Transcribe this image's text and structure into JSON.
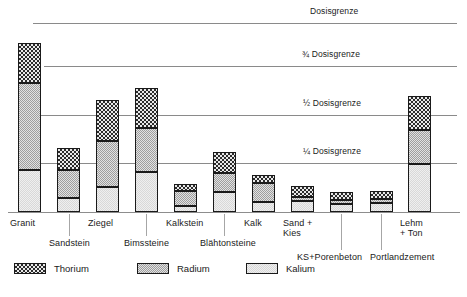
{
  "chart_data": {
    "type": "bar",
    "stacked": true,
    "title": "",
    "xlabel": "",
    "ylabel": "",
    "ylim": [
      0,
      1.15
    ],
    "grid": true,
    "legend_position": "bottom-left",
    "categories": [
      "Granit",
      "Sandstein",
      "Ziegel",
      "Bimssteine",
      "Kalkstein",
      "Blähtonsteine",
      "Kalk",
      "Sand +\nKies",
      "KS+Porenbeton",
      "Portlandzement",
      "Lehm\n+ Ton"
    ],
    "series": [
      {
        "name": "Kalium",
        "values": [
          0.255,
          0.08,
          0.15,
          0.235,
          0.035,
          0.115,
          0.06,
          0.06,
          0.055,
          0.055,
          0.29
        ]
      },
      {
        "name": "Radium",
        "values": [
          0.505,
          0.16,
          0.26,
          0.25,
          0.11,
          0.11,
          0.15,
          0.025,
          0.025,
          0.025,
          0.2
        ]
      },
      {
        "name": "Thorium",
        "values": [
          0.235,
          0.13,
          0.24,
          0.235,
          0.04,
          0.125,
          0.05,
          0.07,
          0.07,
          0.07,
          0.2
        ]
      }
    ],
    "reference_lines": [
      {
        "label": "Dosisgrenze",
        "value": 1.0
      },
      {
        "label": "¾ Dosisgrenze",
        "value": 0.75
      },
      {
        "label": "½ Dosisgrenze",
        "value": 0.5
      },
      {
        "label": "¼ Dosisgrenze",
        "value": 0.25
      }
    ],
    "colors": {
      "thorium": "#2b2b2b",
      "radium": "#9e9e9e",
      "kalium": "#efefef",
      "gridline": "#8a8a8a",
      "baseline": "#8d8d8d",
      "outline": "#1a1a1a"
    }
  },
  "gridlines": [
    {
      "label": "Dosisgrenze",
      "y": 23,
      "x": 33,
      "w": 424,
      "label_x": 310,
      "label_y": 6
    },
    {
      "label": "¾ Dosisgrenze",
      "y": 66,
      "x": 44,
      "w": 413,
      "label_x": 302,
      "label_y": 49
    },
    {
      "label": "½ Dosisgrenze",
      "y": 115,
      "x": 38,
      "w": 419,
      "label_x": 303,
      "label_y": 98
    },
    {
      "label": "¼ Dosisgrenze",
      "y": 163,
      "x": 38,
      "w": 419,
      "label_x": 303,
      "label_y": 146
    }
  ],
  "bars": [
    {
      "name": "granit",
      "label": "Granit",
      "x": 18,
      "w": 23,
      "thorium_top": 43,
      "radium_top": 83,
      "kalium_top": 170,
      "base": 212,
      "label_x": 10,
      "label_y": 218,
      "leader": null
    },
    {
      "name": "sandstein",
      "label": "Sandstein",
      "x": 57,
      "w": 23,
      "thorium_top": 148,
      "radium_top": 170,
      "kalium_top": 198,
      "base": 212,
      "label_x": 49,
      "label_y": 238,
      "leader": {
        "x": 69,
        "top": 214,
        "h": 22
      }
    },
    {
      "name": "ziegel",
      "label": "Ziegel",
      "x": 96,
      "w": 23,
      "thorium_top": 100,
      "radium_top": 141,
      "kalium_top": 187,
      "base": 212,
      "label_x": 88,
      "label_y": 218,
      "leader": null
    },
    {
      "name": "bimssteine",
      "label": "Bimssteine",
      "x": 135,
      "w": 23,
      "thorium_top": 88,
      "radium_top": 128,
      "kalium_top": 172,
      "base": 212,
      "label_x": 124,
      "label_y": 238,
      "leader": {
        "x": 146,
        "top": 214,
        "h": 22
      }
    },
    {
      "name": "kalkstein",
      "label": "Kalkstein",
      "x": 174,
      "w": 23,
      "thorium_top": 184,
      "radium_top": 191,
      "kalium_top": 206,
      "base": 212,
      "label_x": 166,
      "label_y": 218,
      "leader": null
    },
    {
      "name": "blaehtonsteine",
      "label": "Blähtonsteine",
      "x": 213,
      "w": 23,
      "thorium_top": 152,
      "radium_top": 173,
      "kalium_top": 192,
      "base": 212,
      "label_x": 200,
      "label_y": 238,
      "leader": {
        "x": 224,
        "top": 214,
        "h": 22
      }
    },
    {
      "name": "kalk",
      "label": "Kalk",
      "x": 252,
      "w": 23,
      "thorium_top": 175,
      "radium_top": 183,
      "kalium_top": 202,
      "base": 212,
      "label_x": 244,
      "label_y": 218,
      "leader": null
    },
    {
      "name": "sand-kies",
      "label": "Sand +\nKies",
      "x": 291,
      "w": 23,
      "thorium_top": 186,
      "radium_top": 197,
      "kalium_top": 201,
      "base": 212,
      "label_x": 283,
      "label_y": 218,
      "leader": null
    },
    {
      "name": "ks-porenbeton",
      "label": "KS+Porenbeton",
      "x": 330,
      "w": 23,
      "thorium_top": 192,
      "radium_top": 200,
      "kalium_top": 204,
      "base": 212,
      "label_x": 297,
      "label_y": 252,
      "leader": {
        "x": 341,
        "top": 214,
        "h": 36
      }
    },
    {
      "name": "portlandzement",
      "label": "Portlandzement",
      "x": 370,
      "w": 23,
      "thorium_top": 191,
      "radium_top": 199,
      "kalium_top": 203,
      "base": 212,
      "label_x": 370,
      "label_y": 252,
      "leader": {
        "x": 381,
        "top": 214,
        "h": 36
      }
    },
    {
      "name": "lehm-ton",
      "label": "Lehm\n+ Ton",
      "x": 408,
      "w": 23,
      "thorium_top": 96,
      "radium_top": 130,
      "kalium_top": 164,
      "base": 212,
      "label_x": 400,
      "label_y": 218,
      "leader": null
    }
  ],
  "legend": {
    "items": [
      {
        "name": "thorium",
        "label": "Thorium",
        "x": 0
      },
      {
        "name": "radium",
        "label": "Radium",
        "x": 123
      },
      {
        "name": "kalium",
        "label": "Kalium",
        "x": 232
      }
    ]
  }
}
